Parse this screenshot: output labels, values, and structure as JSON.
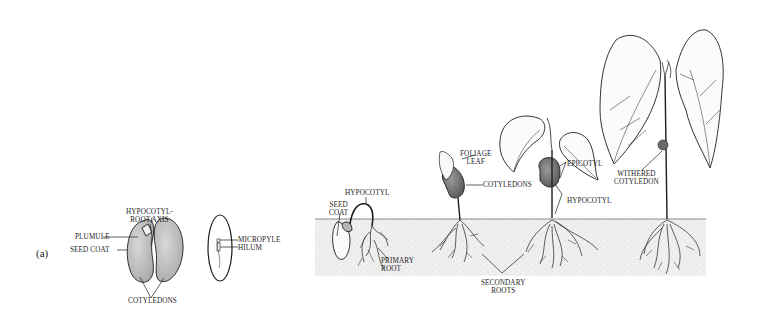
{
  "figure": {
    "panel_label": "(a)",
    "seed_section": {
      "labels": {
        "hypocotyl_root_axis": [
          "HYPOCOTYL-",
          "ROOT AXIS"
        ],
        "plumule": "PLUMULE",
        "seed_coat": "SEED COAT",
        "cotyledons": "COTYLEDONS"
      }
    },
    "seed_side_view": {
      "labels": {
        "micropyle": "MICROPYLE",
        "hilum": "HILUM"
      }
    },
    "germination_sequence": {
      "labels": {
        "seed_coat": [
          "SEED",
          "COAT"
        ],
        "hypocotyl_stage1": "HYPOCOTYL",
        "primary_root": [
          "PRIMARY",
          "ROOT"
        ],
        "foliage_leaf": [
          "FOLIAGE",
          "LEAF"
        ],
        "cotyledons": "COTYLEDONS",
        "epicotyl": "EPICOTYL",
        "hypocotyl_stage3": "HYPOCOTYL",
        "secondary_roots": [
          "SECONDARY",
          "ROOTS"
        ],
        "withered_cotyledon": [
          "WITHERED",
          "COTYLEDON"
        ]
      }
    },
    "colors": {
      "line": "#1e1e1e",
      "soil": "#ededed",
      "soil_edge": "#8a8a8a",
      "cotyledon_fill": "#c9c9c9"
    }
  }
}
